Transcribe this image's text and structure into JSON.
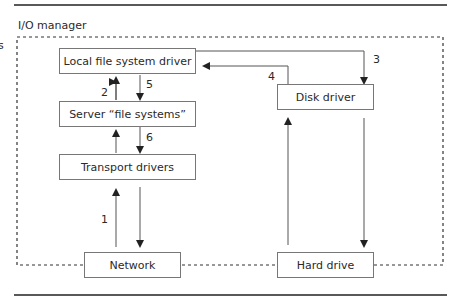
{
  "diagram": {
    "region_label": "I/O manager",
    "edge_fragment": "s",
    "boxes": {
      "local_fs": "Local file system driver",
      "server_fs": "Server “file systems”",
      "transport": "Transport drivers",
      "network": "Network",
      "disk_driver": "Disk driver",
      "hard_drive": "Hard drive"
    },
    "steps": {
      "s1": "1",
      "s2": "2",
      "s3": "3",
      "s4": "4",
      "s5": "5",
      "s6": "6"
    },
    "colors": {
      "line": "#555555",
      "box_border": "#777777",
      "rule": "#222222"
    }
  }
}
